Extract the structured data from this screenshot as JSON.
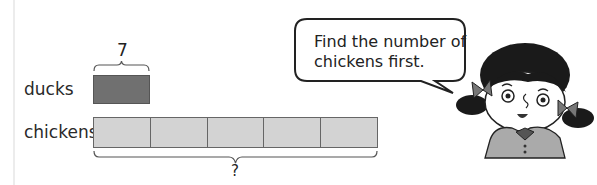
{
  "diagram": {
    "top_label": "7",
    "bottom_label": "?",
    "rows": [
      {
        "label": "ducks",
        "segments": 1,
        "fill": "#707070"
      },
      {
        "label": "chickens",
        "segments": 5,
        "fill": "#d3d3d3"
      }
    ]
  },
  "speech_bubble": {
    "line1": "Find the number of",
    "line2": "chickens first."
  },
  "character": "girl-with-pigtails"
}
